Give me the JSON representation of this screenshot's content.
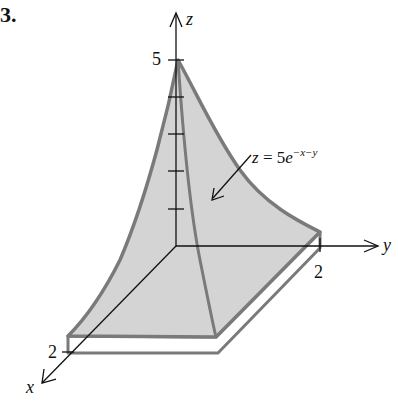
{
  "figure": {
    "number": "3.",
    "equation": {
      "lhs": "z",
      "equals": " = 5",
      "base": "e",
      "exponent": "−x−y"
    },
    "axes": {
      "z": {
        "label": "z",
        "tick_label": "5",
        "ticks": 5
      },
      "y": {
        "label": "y",
        "tick_label": "2"
      },
      "x": {
        "label": "x",
        "tick_label": "2"
      }
    },
    "colors": {
      "surface_fill": "#d4d4d4",
      "surface_edge": "#7a7a7a",
      "axis": "#111111",
      "background": "#ffffff"
    }
  }
}
